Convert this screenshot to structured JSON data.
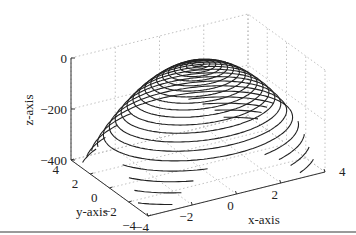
{
  "chart_data": {
    "type": "3d-contour",
    "title": "",
    "xlabel": "x-axis",
    "ylabel": "y-axis",
    "zlabel": "z-axis",
    "xlim": [
      -4,
      4
    ],
    "ylim": [
      -4,
      4
    ],
    "zlim": [
      -400,
      0
    ],
    "x_ticks": [
      -4,
      -2,
      0,
      2,
      4
    ],
    "y_ticks": [
      -4,
      -2,
      0,
      2,
      4
    ],
    "z_ticks": [
      -400,
      -200,
      0
    ],
    "x_tick_labels": [
      "−4",
      "−2",
      "0",
      "2",
      "4"
    ],
    "y_tick_labels": [
      "−4",
      "−2",
      "0",
      "2",
      "4"
    ],
    "z_tick_labels": [
      "−400",
      "−200",
      "0"
    ],
    "grid": true,
    "grid_style": "dotted",
    "surface": "concave-down paraboloid drawn as stacked horizontal contour rings (z = -(x^2+y^2) scaled), black lines",
    "contour_levels": 20,
    "line_color": "#222222"
  },
  "figure": {
    "background": "#ffffff",
    "grid_color": "#b0b0b0",
    "axis_color": "#333333"
  }
}
